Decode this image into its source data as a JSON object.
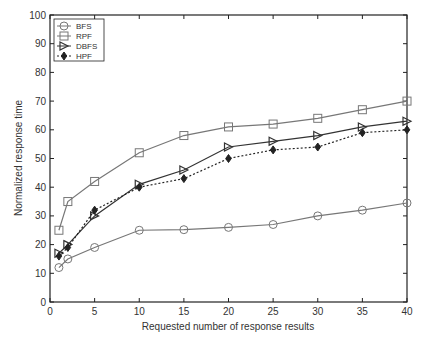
{
  "chart_data": {
    "type": "line",
    "title": "",
    "xlabel": "Requested number of response results",
    "ylabel": "Normalized response time",
    "xlim": [
      0,
      40
    ],
    "ylim": [
      0,
      100
    ],
    "xticks": [
      0,
      5,
      10,
      15,
      20,
      25,
      30,
      35,
      40
    ],
    "yticks": [
      0,
      10,
      20,
      30,
      40,
      50,
      60,
      70,
      80,
      90,
      100
    ],
    "grid": false,
    "legend_position": "upper left",
    "x": [
      1,
      2,
      5,
      10,
      15,
      20,
      25,
      30,
      35,
      40
    ],
    "series": [
      {
        "name": "BFS",
        "marker": "circle",
        "line": "solid",
        "color": "#777777",
        "values": [
          12,
          15,
          19,
          25,
          25.2,
          26,
          27,
          30,
          32,
          34.5
        ]
      },
      {
        "name": "RPF",
        "marker": "square",
        "line": "solid",
        "color": "#777777",
        "values": [
          25,
          35,
          42,
          52,
          58,
          61,
          62,
          64,
          67,
          70
        ]
      },
      {
        "name": "DBFS",
        "marker": "triangle-right",
        "line": "solid",
        "color": "#333333",
        "values": [
          17,
          20,
          30,
          41,
          46,
          54,
          56,
          58,
          61,
          63
        ]
      },
      {
        "name": "HPF",
        "marker": "diamond",
        "line": "dotted",
        "color": "#222222",
        "values": [
          16,
          19,
          32,
          40,
          43,
          50,
          53,
          54,
          59,
          60
        ]
      }
    ]
  }
}
